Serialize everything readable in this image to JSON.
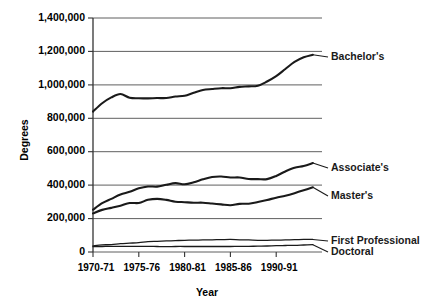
{
  "chart_data": {
    "type": "line",
    "title": "",
    "xlabel": "Year",
    "ylabel": "Degrees",
    "ylim": [
      0,
      1400000
    ],
    "xlim": [
      1970,
      1995
    ],
    "grid": true,
    "legend_position": "right-inline-labels",
    "ytick_labels": [
      "1,400,000",
      "1,200,000",
      "1,000,000",
      "800,000",
      "600,000",
      "400,000",
      "200,000",
      "0"
    ],
    "ytick_values": [
      1400000,
      1200000,
      1000000,
      800000,
      600000,
      400000,
      200000,
      0
    ],
    "xtick_labels": [
      "1970-71",
      "1975-76",
      "1980-81",
      "1985-86",
      "1990-91"
    ],
    "xtick_values": [
      1970,
      1975,
      1980,
      1985,
      1990
    ],
    "x": [
      1970,
      1971,
      1972,
      1973,
      1974,
      1975,
      1976,
      1977,
      1978,
      1979,
      1980,
      1981,
      1982,
      1983,
      1984,
      1985,
      1986,
      1987,
      1988,
      1989,
      1990,
      1991,
      1992,
      1993,
      1994
    ],
    "series": [
      {
        "name": "Bachelor's",
        "label": "Bachelor's",
        "values": [
          840000,
          890000,
          925000,
          945000,
          923000,
          920000,
          919000,
          921000,
          921000,
          930000,
          935000,
          953000,
          969000,
          975000,
          980000,
          980000,
          988000,
          991000,
          995000,
          1020000,
          1052000,
          1095000,
          1137000,
          1165000,
          1180000
        ]
      },
      {
        "name": "Associate's",
        "label": "Associate's",
        "values": [
          253000,
          292000,
          318000,
          344000,
          360000,
          381000,
          392000,
          391000,
          402000,
          412000,
          405000,
          417000,
          435000,
          449000,
          452000,
          446000,
          446000,
          437000,
          436000,
          436000,
          455000,
          482000,
          504000,
          515000,
          532000
        ]
      },
      {
        "name": "Master's",
        "label": "Master's",
        "values": [
          231000,
          252000,
          264000,
          277000,
          293000,
          293000,
          312000,
          318000,
          312000,
          301000,
          298000,
          295000,
          295000,
          290000,
          285000,
          280000,
          288000,
          289000,
          299000,
          311000,
          325000,
          337000,
          352000,
          369000,
          387000
        ]
      },
      {
        "name": "First Professional",
        "label": "First Professional",
        "values": [
          37000,
          43000,
          44000,
          50000,
          53000,
          56000,
          62000,
          64000,
          66000,
          68000,
          70000,
          71000,
          72000,
          73000,
          74000,
          75000,
          73000,
          72000,
          70000,
          70000,
          71000,
          72000,
          74000,
          75000,
          75000
        ]
      },
      {
        "name": "Doctoral",
        "label": "Doctoral",
        "values": [
          32000,
          33000,
          34000,
          34000,
          34000,
          34000,
          34000,
          33000,
          32000,
          33000,
          33000,
          33000,
          33000,
          33000,
          33000,
          33000,
          34000,
          34000,
          35000,
          36000,
          38000,
          39000,
          40000,
          42000,
          44000
        ]
      }
    ]
  },
  "axes": {
    "y_title": "Degrees",
    "x_title": "Year"
  }
}
